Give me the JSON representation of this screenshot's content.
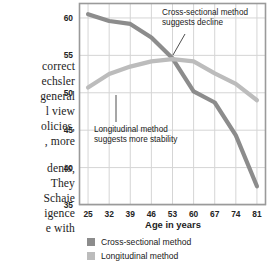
{
  "page": {
    "body_text_lines": [
      "correct",
      "echsler",
      "general",
      "l view",
      "olicies,",
      ", more",
      "dents,",
      "They",
      "Schaie",
      "igence",
      "e with"
    ]
  },
  "chart_data": {
    "type": "line",
    "title": "",
    "xlabel": "Age in years",
    "ylabel": "Reasoning\nability score",
    "x": [
      25,
      32,
      39,
      46,
      53,
      60,
      67,
      74,
      81
    ],
    "xticklabels": [
      "25",
      "32",
      "39",
      "46",
      "53",
      "60",
      "67",
      "74",
      "81"
    ],
    "yticklabels": [
      "35",
      "40",
      "45",
      "50",
      "55",
      "60"
    ],
    "ylim": [
      35,
      62
    ],
    "xlim": [
      22,
      84
    ],
    "grid": true,
    "legend_position": "bottom-left",
    "series": [
      {
        "name": "Cross-sectional method",
        "color": "#8c8c8c",
        "values": [
          60.5,
          59.6,
          59.2,
          57.4,
          54.6,
          50.2,
          48.7,
          44.3,
          37.5
        ]
      },
      {
        "name": "Longitudinal method",
        "color": "#bcbcbc",
        "values": [
          50.7,
          52.5,
          53.5,
          54.2,
          54.5,
          54.2,
          52.6,
          51.2,
          49.0
        ]
      }
    ],
    "annotations": [
      {
        "id": "cross-sectional",
        "text": "Cross-sectional method\nsuggests decline",
        "leader_from": [
          185,
          34
        ],
        "leader_to": [
          173,
          55
        ]
      },
      {
        "id": "longitudinal",
        "text": "Longitudinal method\nsuggests more stability",
        "leader_from": [
          116,
          122
        ],
        "leader_to": [
          116,
          95
        ]
      }
    ]
  },
  "legend": {
    "items": [
      {
        "label": "Cross-sectional method",
        "color": "#8c8c8c"
      },
      {
        "label": "Longitudinal method",
        "color": "#bcbcbc"
      }
    ]
  },
  "colors": {
    "cross_sectional": "#8c8c8c",
    "longitudinal": "#bcbcbc",
    "grid": "#d5d5d5",
    "frame": "#9a9a9a",
    "text": "#1a1a1a"
  }
}
